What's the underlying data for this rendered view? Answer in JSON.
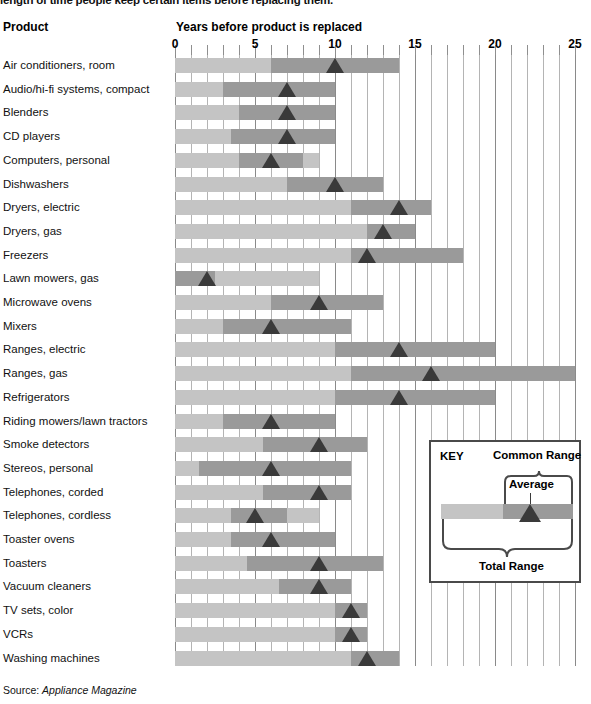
{
  "intro_text": "length of time people keep certain items before replacing them.",
  "header": {
    "product_col": "Product",
    "axis_title": "Years before product is replaced"
  },
  "source": {
    "label": "Source:",
    "value": "Appliance Magazine"
  },
  "key": {
    "title": "KEY",
    "common_range": "Common Range",
    "average": "Average",
    "total_range": "Total Range"
  },
  "colors": {
    "total_range": "#c4c4c4",
    "common_range": "#9a9a9a",
    "average_marker": "#3a3a3a",
    "gridline": "#b4b4b4",
    "gridline_major": "#8a8a8a",
    "text": "#111111",
    "background": "#ffffff"
  },
  "chart_data": {
    "type": "bar",
    "title": "Years before product is replaced",
    "xlabel": "Years before product is replaced",
    "ylabel": "Product",
    "xlim": [
      0,
      25
    ],
    "tick_labels": [
      "0",
      "5",
      "10",
      "15",
      "20",
      "25"
    ],
    "tick_values": [
      0,
      5,
      10,
      15,
      20,
      25
    ],
    "minor_tick_step": 1,
    "grid": true,
    "legend_position": "inset-bottom-right",
    "series": [
      {
        "name": "Total Range",
        "kind": "range"
      },
      {
        "name": "Common Range",
        "kind": "range"
      },
      {
        "name": "Average",
        "kind": "marker"
      }
    ],
    "categories": [
      "Air conditioners, room",
      "Audio/hi-fi systems, compact",
      "Blenders",
      "CD players",
      "Computers, personal",
      "Dishwashers",
      "Dryers, electric",
      "Dryers, gas",
      "Freezers",
      "Lawn mowers, gas",
      "Microwave ovens",
      "Mixers",
      "Ranges, electric",
      "Ranges, gas",
      "Refrigerators",
      "Riding mowers/lawn tractors",
      "Smoke detectors",
      "Stereos, personal",
      "Telephones, corded",
      "Telephones, cordless",
      "Toaster ovens",
      "Toasters",
      "Vacuum cleaners",
      "TV sets, color",
      "VCRs",
      "Washing machines"
    ],
    "rows": [
      {
        "product": "Air conditioners, room",
        "total_start": 0,
        "total_end": 14,
        "common_start": 6,
        "common_end": 14,
        "average": 10
      },
      {
        "product": "Audio/hi-fi systems, compact",
        "total_start": 0,
        "total_end": 10,
        "common_start": 3,
        "common_end": 10,
        "average": 7
      },
      {
        "product": "Blenders",
        "total_start": 0,
        "total_end": 10,
        "common_start": 4,
        "common_end": 10,
        "average": 7
      },
      {
        "product": "CD players",
        "total_start": 0,
        "total_end": 10,
        "common_start": 3.5,
        "common_end": 10,
        "average": 7
      },
      {
        "product": "Computers, personal",
        "total_start": 0,
        "total_end": 9,
        "common_start": 4,
        "common_end": 8,
        "average": 6
      },
      {
        "product": "Dishwashers",
        "total_start": 0,
        "total_end": 13,
        "common_start": 7,
        "common_end": 13,
        "average": 10
      },
      {
        "product": "Dryers, electric",
        "total_start": 0,
        "total_end": 16,
        "common_start": 11,
        "common_end": 16,
        "average": 14
      },
      {
        "product": "Dryers, gas",
        "total_start": 0,
        "total_end": 15,
        "common_start": 12,
        "common_end": 15,
        "average": 13
      },
      {
        "product": "Freezers",
        "total_start": 0,
        "total_end": 18,
        "common_start": 11,
        "common_end": 18,
        "average": 12
      },
      {
        "product": "Lawn mowers, gas",
        "total_start": 0,
        "total_end": 9,
        "common_start": 0,
        "common_end": 2.5,
        "average": 2
      },
      {
        "product": "Microwave ovens",
        "total_start": 0,
        "total_end": 13,
        "common_start": 6,
        "common_end": 13,
        "average": 9
      },
      {
        "product": "Mixers",
        "total_start": 0,
        "total_end": 11,
        "common_start": 3,
        "common_end": 11,
        "average": 6
      },
      {
        "product": "Ranges, electric",
        "total_start": 0,
        "total_end": 20,
        "common_start": 10,
        "common_end": 20,
        "average": 14
      },
      {
        "product": "Ranges, gas",
        "total_start": 0,
        "total_end": 25,
        "common_start": 11,
        "common_end": 25,
        "average": 16
      },
      {
        "product": "Refrigerators",
        "total_start": 0,
        "total_end": 20,
        "common_start": 10,
        "common_end": 20,
        "average": 14
      },
      {
        "product": "Riding mowers/lawn tractors",
        "total_start": 0,
        "total_end": 10,
        "common_start": 3,
        "common_end": 10,
        "average": 6
      },
      {
        "product": "Smoke detectors",
        "total_start": 0,
        "total_end": 12,
        "common_start": 5.5,
        "common_end": 12,
        "average": 9
      },
      {
        "product": "Stereos, personal",
        "total_start": 0,
        "total_end": 11,
        "common_start": 1.5,
        "common_end": 11,
        "average": 6
      },
      {
        "product": "Telephones, corded",
        "total_start": 0,
        "total_end": 11,
        "common_start": 5.5,
        "common_end": 11,
        "average": 9
      },
      {
        "product": "Telephones, cordless",
        "total_start": 0,
        "total_end": 9,
        "common_start": 3.5,
        "common_end": 7,
        "average": 5
      },
      {
        "product": "Toaster ovens",
        "total_start": 0,
        "total_end": 10,
        "common_start": 3.5,
        "common_end": 10,
        "average": 6
      },
      {
        "product": "Toasters",
        "total_start": 0,
        "total_end": 13,
        "common_start": 4.5,
        "common_end": 13,
        "average": 9
      },
      {
        "product": "Vacuum cleaners",
        "total_start": 0,
        "total_end": 11,
        "common_start": 6.5,
        "common_end": 11,
        "average": 9
      },
      {
        "product": "TV sets, color",
        "total_start": 0,
        "total_end": 12,
        "common_start": 10,
        "common_end": 12,
        "average": 11
      },
      {
        "product": "VCRs",
        "total_start": 0,
        "total_end": 12,
        "common_start": 10,
        "common_end": 12,
        "average": 11
      },
      {
        "product": "Washing machines",
        "total_start": 0,
        "total_end": 14,
        "common_start": 11,
        "common_end": 14,
        "average": 12
      }
    ]
  }
}
